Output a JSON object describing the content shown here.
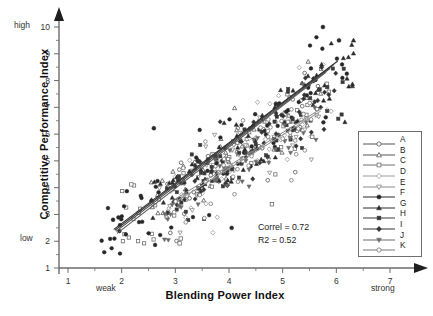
{
  "chart_data": {
    "type": "scatter",
    "title": "",
    "xlabel": "Blending Power Index",
    "ylabel": "Competitive Performance Index",
    "xlim": [
      1,
      7
    ],
    "ylim": [
      1,
      10
    ],
    "xticks": [
      1,
      2,
      3,
      4,
      5,
      6,
      7
    ],
    "yticks": [
      1,
      2,
      3,
      4,
      5,
      6,
      7,
      8,
      9,
      10
    ],
    "x_minor_step": 0.5,
    "y_minor_step": 0.5,
    "grid": false,
    "axis_style": "arrow-ended open axes",
    "x_low_word": "weak",
    "x_high_word": "strong",
    "y_low_word": "low",
    "y_high_word": "high",
    "annotations": [
      {
        "text": "Correl = 0.72"
      },
      {
        "text": "R2 = 0.52"
      }
    ],
    "statistics": {
      "correlation": 0.72,
      "r_squared": 0.52
    },
    "legend_position": "right",
    "series": [
      {
        "name": "A",
        "marker": "circle",
        "fill": "open",
        "color": "#555555",
        "n": 46,
        "slope": 1.3,
        "intercept": -0.15,
        "spread": 0.62,
        "xmin": 2.7,
        "xmax": 5.7
      },
      {
        "name": "B",
        "marker": "triangle",
        "fill": "open",
        "color": "#555555",
        "n": 46,
        "slope": 1.34,
        "intercept": -0.28,
        "spread": 0.6,
        "xmin": 2.6,
        "xmax": 5.9
      },
      {
        "name": "C",
        "marker": "square",
        "fill": "open",
        "color": "#707070",
        "n": 48,
        "slope": 1.22,
        "intercept": -0.05,
        "spread": 0.75,
        "xmin": 2.1,
        "xmax": 5.8
      },
      {
        "name": "D",
        "marker": "diamond",
        "fill": "open",
        "color": "#9a9a9a",
        "n": 42,
        "slope": 1.28,
        "intercept": -0.1,
        "spread": 0.68,
        "xmin": 2.8,
        "xmax": 5.8
      },
      {
        "name": "E",
        "marker": "triangle-down",
        "fill": "open",
        "color": "#8a8a8a",
        "n": 42,
        "slope": 1.18,
        "intercept": 0.1,
        "spread": 0.7,
        "xmin": 2.6,
        "xmax": 5.7
      },
      {
        "name": "F",
        "marker": "circle",
        "fill": "filled",
        "color": "#262626",
        "n": 80,
        "slope": 1.42,
        "intercept": -0.35,
        "spread": 0.72,
        "xmin": 1.8,
        "xmax": 6.0
      },
      {
        "name": "G",
        "marker": "triangle",
        "fill": "filled",
        "color": "#2b2b2b",
        "n": 70,
        "slope": 1.4,
        "intercept": -0.38,
        "spread": 0.66,
        "xmin": 2.6,
        "xmax": 6.3
      },
      {
        "name": "H",
        "marker": "square",
        "fill": "filled",
        "color": "#3a3a3a",
        "n": 62,
        "slope": 1.3,
        "intercept": -0.18,
        "spread": 0.64,
        "xmin": 2.9,
        "xmax": 6.1
      },
      {
        "name": "I",
        "marker": "diamond",
        "fill": "filled",
        "color": "#333333",
        "n": 58,
        "slope": 1.33,
        "intercept": -0.22,
        "spread": 0.63,
        "xmin": 3.0,
        "xmax": 6.0
      },
      {
        "name": "J",
        "marker": "triangle-down",
        "fill": "filled",
        "color": "#6a6a6a",
        "n": 46,
        "slope": 1.12,
        "intercept": 0.18,
        "spread": 0.7,
        "xmin": 2.7,
        "xmax": 5.7
      },
      {
        "name": "K",
        "marker": "circle",
        "fill": "open",
        "color": "#777777",
        "n": 44,
        "slope": 1.2,
        "intercept": 0.0,
        "spread": 0.72,
        "xmin": 2.9,
        "xmax": 5.6
      }
    ],
    "outliers": [
      {
        "x": 5.75,
        "y": 10.0,
        "series": "F"
      },
      {
        "x": 6.32,
        "y": 9.5,
        "series": "G"
      },
      {
        "x": 6.05,
        "y": 9.5,
        "series": "F"
      },
      {
        "x": 2.6,
        "y": 6.22,
        "series": "F"
      },
      {
        "x": 2.18,
        "y": 4.12,
        "series": "C"
      },
      {
        "x": 1.84,
        "y": 2.8,
        "series": "F"
      },
      {
        "x": 4.05,
        "y": 2.5,
        "series": "F"
      },
      {
        "x": 3.08,
        "y": 1.92,
        "series": "C"
      },
      {
        "x": 3.1,
        "y": 2.1,
        "series": "C"
      },
      {
        "x": 4.8,
        "y": 3.38,
        "series": "C"
      },
      {
        "x": 5.55,
        "y": 5.9,
        "series": "C"
      },
      {
        "x": 3.7,
        "y": 2.32,
        "series": "D"
      }
    ],
    "trend_lines": [
      {
        "series": "F",
        "x1": 1.86,
        "y1": 2.45,
        "x2": 6.02,
        "y2": 8.72,
        "color": "#2e2e2e"
      },
      {
        "series": "G",
        "x1": 1.88,
        "y1": 2.42,
        "x2": 5.95,
        "y2": 8.6,
        "color": "#3a3a3a"
      },
      {
        "series": "B",
        "x1": 1.9,
        "y1": 2.38,
        "x2": 5.88,
        "y2": 8.45,
        "color": "#4a4a4a"
      },
      {
        "series": "A",
        "x1": 1.92,
        "y1": 2.3,
        "x2": 5.8,
        "y2": 8.3,
        "color": "#5a5a5a"
      },
      {
        "series": "J",
        "x1": 3.02,
        "y1": 3.6,
        "x2": 5.72,
        "y2": 6.95,
        "color": "#8a8a8a"
      },
      {
        "series": "E",
        "x1": 3.05,
        "y1": 3.52,
        "x2": 5.7,
        "y2": 6.85,
        "color": "#9a9a9a"
      }
    ]
  },
  "legend": {
    "entries": [
      {
        "label": "A"
      },
      {
        "label": "B"
      },
      {
        "label": "C"
      },
      {
        "label": "D"
      },
      {
        "label": "E"
      },
      {
        "label": "F"
      },
      {
        "label": "G"
      },
      {
        "label": "H"
      },
      {
        "label": "I"
      },
      {
        "label": "J"
      },
      {
        "label": "K"
      }
    ]
  },
  "colors": {
    "axis": "#6b6b6b",
    "text": "#1a1a1a",
    "legend_border": "#6f6f6f",
    "background": "#ffffff"
  }
}
